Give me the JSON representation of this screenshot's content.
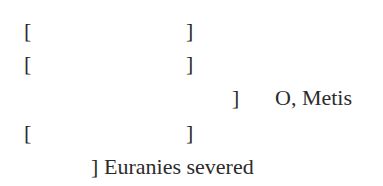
{
  "fragment": {
    "lines": [
      {
        "left": "[",
        "right": "]",
        "text": ""
      },
      {
        "left": "[",
        "right": "]",
        "text": ""
      },
      {
        "left": "",
        "right": "]",
        "text": "O, Metis"
      },
      {
        "left": "[",
        "right": "]",
        "text": ""
      },
      {
        "left": "",
        "right": "]",
        "text": "Euranies severed"
      }
    ]
  },
  "colors": {
    "text": "#2b2b2b",
    "background": "#ffffff"
  }
}
